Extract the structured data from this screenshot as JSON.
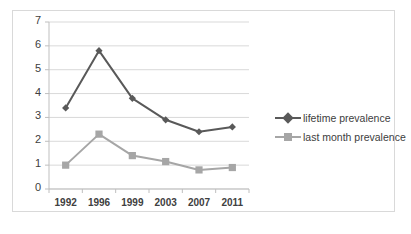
{
  "chart_data": {
    "type": "line",
    "title": "",
    "xlabel": "",
    "ylabel": "",
    "categories": [
      "1992",
      "1996",
      "1999",
      "2003",
      "2007",
      "2011"
    ],
    "ylim": [
      0,
      7
    ],
    "yticks": [
      "0",
      "1",
      "2",
      "3",
      "4",
      "5",
      "6",
      "7"
    ],
    "grid": true,
    "legend_position": "right",
    "series": [
      {
        "name": "lifetime prevalence",
        "color": "#595959",
        "marker": "diamond",
        "values": [
          3.4,
          5.8,
          3.8,
          2.9,
          2.4,
          2.6
        ]
      },
      {
        "name": "last month prevalence",
        "color": "#a6a6a6",
        "marker": "square",
        "values": [
          1.0,
          2.3,
          1.4,
          1.15,
          0.8,
          0.9
        ]
      }
    ]
  },
  "colors": {
    "series_lifetime": "#595959",
    "series_last_month": "#a6a6a6",
    "gridline": "#d9d9d9",
    "axis": "#bfbfbf",
    "border": "#d9d9d9",
    "text": "#404040"
  }
}
